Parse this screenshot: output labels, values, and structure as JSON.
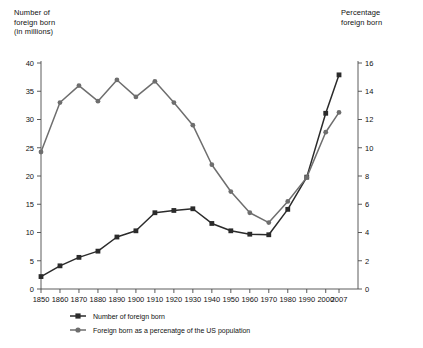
{
  "chart_data": {
    "type": "line",
    "title": "",
    "subtitle": "",
    "xlabel": "",
    "ylabel": "Number of foreign born (in millions)",
    "y2label": "Percentage foreign born",
    "grid": false,
    "legend_position": "bottom",
    "x": [
      1850,
      1860,
      1870,
      1880,
      1890,
      1900,
      1910,
      1920,
      1930,
      1940,
      1950,
      1960,
      1970,
      1980,
      1990,
      2000,
      2007
    ],
    "xtick_labels": [
      "1850",
      "1860",
      "1870",
      "1880",
      "1890",
      "1900",
      "1910",
      "1920",
      "1930",
      "1940",
      "1950",
      "1960",
      "1970",
      "1980",
      "1990",
      "2000",
      "2007"
    ],
    "ylim": [
      0,
      40
    ],
    "ytick_labels": [
      "0",
      "5",
      "10",
      "15",
      "20",
      "25",
      "30",
      "35",
      "40"
    ],
    "ytick_values": [
      0,
      5,
      10,
      15,
      20,
      25,
      30,
      35,
      40
    ],
    "y2lim": [
      0,
      16
    ],
    "y2tick_labels": [
      "0",
      "2",
      "4",
      "6",
      "8",
      "10",
      "12",
      "14",
      "16"
    ],
    "y2tick_values": [
      0,
      2,
      4,
      6,
      8,
      10,
      12,
      14,
      16
    ],
    "series": [
      {
        "name": "Number of foreign born",
        "axis": "left",
        "color": "#2b2b2b",
        "marker": "square",
        "values": [
          2.2,
          4.1,
          5.6,
          6.7,
          9.2,
          10.3,
          13.5,
          13.9,
          14.2,
          11.6,
          10.3,
          9.7,
          9.6,
          14.1,
          19.8,
          31.1,
          37.9
        ]
      },
      {
        "name": "Foreign born as a percenatge of the US population",
        "axis": "right",
        "color": "#6e6e6e",
        "marker": "circle",
        "values": [
          9.7,
          13.2,
          14.4,
          13.3,
          14.8,
          13.6,
          14.7,
          13.2,
          11.6,
          8.8,
          6.9,
          5.4,
          4.7,
          6.2,
          7.9,
          11.1,
          12.5
        ]
      }
    ]
  },
  "labels": {
    "left_axis_title": "Number of\nforeign born\n(in millions)",
    "right_axis_title": "Percentage\nforeign born"
  }
}
